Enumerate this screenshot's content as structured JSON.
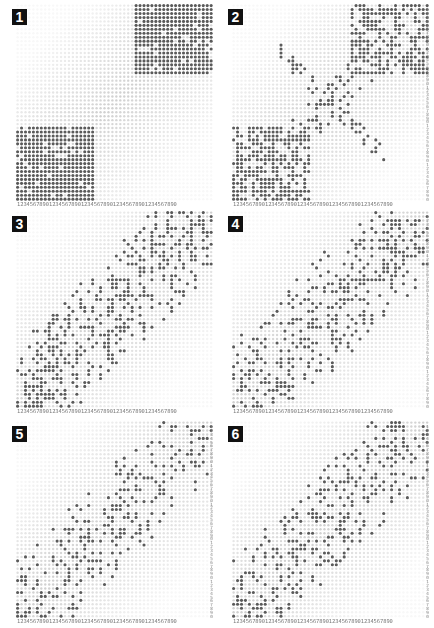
{
  "chart_data": {
    "type": "heatmap",
    "title": "",
    "grid_size": [
      50,
      50
    ],
    "axis_tick_pattern": "1234567890",
    "xlabel": "",
    "ylabel": "",
    "colors": {
      "filled": "#5a5a5a",
      "empty": "#d9d9d9",
      "badge_bg": "#111111",
      "badge_fg": "#ffffff"
    },
    "panels": [
      {
        "label": "1",
        "mode": "blocks",
        "fill_prob_in": 0.92,
        "fill_prob_out": 0.0,
        "blocks": [
          [
            0,
            20,
            0,
            19
          ],
          [
            30,
            50,
            32,
            50
          ]
        ],
        "seed": 11
      },
      {
        "label": "2",
        "mode": "blocks_scatter",
        "fill_prob_in": 0.62,
        "fill_prob_out": 0.0,
        "blocks": [
          [
            0,
            20,
            0,
            19
          ],
          [
            30,
            50,
            32,
            50
          ]
        ],
        "band_prob": 0.55,
        "band_width": 3,
        "seed": 23
      },
      {
        "label": "3",
        "mode": "diagonal",
        "fill_prob_in": 0.45,
        "band_width": 16,
        "seed": 37
      },
      {
        "label": "4",
        "mode": "diagonal",
        "fill_prob_in": 0.36,
        "band_width": 17,
        "seed": 41
      },
      {
        "label": "5",
        "mode": "diagonal",
        "fill_prob_in": 0.3,
        "band_width": 15,
        "seed": 53
      },
      {
        "label": "6",
        "mode": "diagonal",
        "fill_prob_in": 0.3,
        "band_width": 15,
        "seed": 67
      }
    ]
  },
  "axis": {
    "x_ticks": "12345678901234567890123456789012345678901234567890",
    "y_ticks": "12345678901234567890123456789012345678901234567890"
  },
  "panels": [
    {
      "label": "1"
    },
    {
      "label": "2"
    },
    {
      "label": "3"
    },
    {
      "label": "4"
    },
    {
      "label": "5"
    },
    {
      "label": "6"
    }
  ]
}
